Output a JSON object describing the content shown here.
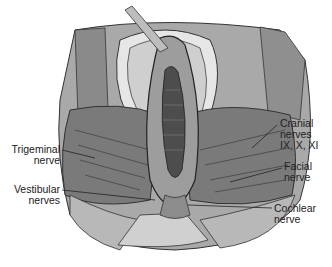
{
  "figure": {
    "labels": {
      "trigeminal": {
        "line1": "Trigeminal",
        "line2": "nerve"
      },
      "vestibular": {
        "line1": "Vestibular",
        "line2": "nerves"
      },
      "cranial": {
        "line1": "Cranial",
        "line2": "nerves",
        "line3": "IX, X, XI"
      },
      "facial": {
        "line1": "Facial",
        "line2": "nerve"
      },
      "cochlear": {
        "line1": "Cochlear",
        "line2": "nerve"
      }
    },
    "colors": {
      "background": "#ffffff",
      "dark_tissue": "#6e6e6e",
      "mid_tissue": "#9a9a9a",
      "light_tissue": "#c8c8c8",
      "bone": "#d8d8d8",
      "text": "#222222"
    }
  }
}
